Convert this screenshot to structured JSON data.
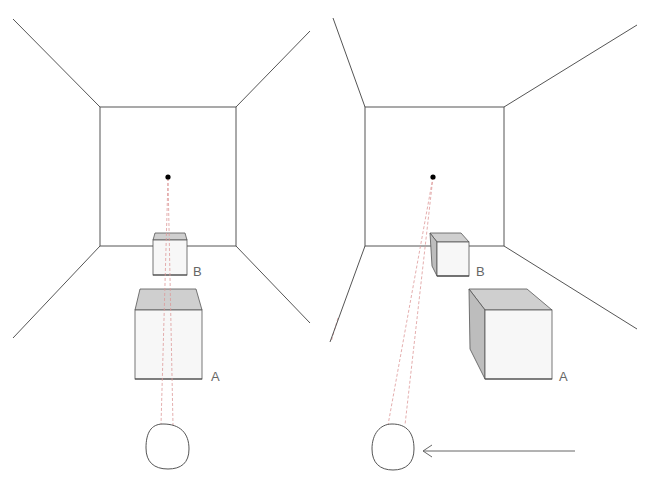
{
  "diagram": {
    "panels": [
      {
        "id": "left",
        "description": "Viewer centered, objects aligned along line of sight",
        "labels": {
          "box_a": "A",
          "box_b": "B"
        }
      },
      {
        "id": "right",
        "description": "Viewer moved left, objects seen in perspective from an angle",
        "labels": {
          "box_a": "A",
          "box_b": "B"
        }
      }
    ],
    "colors": {
      "line": "#555555",
      "box_top": "#cfcfcf",
      "box_side": "#bdbdbd",
      "box_front": "#f7f7f7",
      "sight_line": "#dd9999",
      "vanishing_point": "#000000"
    },
    "arrow": {
      "direction": "left",
      "meaning": "viewer movement"
    }
  }
}
